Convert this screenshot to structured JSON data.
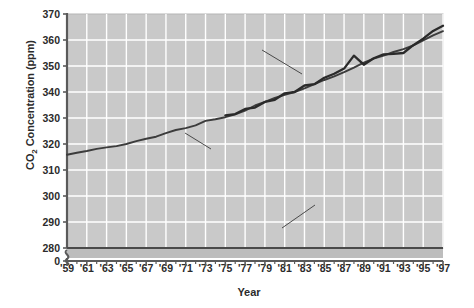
{
  "chart_data": {
    "type": "line",
    "title": "",
    "xlabel": "Year",
    "ylabel": "CO2 Concentration (ppm)",
    "ylabel_display": "CO₂ Concentration (ppm)",
    "ylim": [
      280,
      370
    ],
    "xlim": [
      1959,
      1997
    ],
    "grid": true,
    "legend_position": "inline-annotations",
    "y_ticks": [
      "370",
      "360",
      "350",
      "340",
      "330",
      "320",
      "310",
      "300",
      "290",
      "280",
      "0"
    ],
    "y_tick_values": [
      370,
      360,
      350,
      340,
      330,
      320,
      310,
      300,
      290,
      280,
      0
    ],
    "axis_break": true,
    "axis_break_note": "y-axis broken between 280 and 0",
    "x_ticks": [
      "'59",
      "'61",
      "'63",
      "'65",
      "'67",
      "'69",
      "'71",
      "'73",
      "'75",
      "'77",
      "'79",
      "'81",
      "'83",
      "'85",
      "'87",
      "'89",
      "'91",
      "'93",
      "'95",
      "'97"
    ],
    "x_tick_values": [
      1959,
      1961,
      1963,
      1965,
      1967,
      1969,
      1971,
      1973,
      1975,
      1977,
      1979,
      1981,
      1983,
      1985,
      1987,
      1989,
      1991,
      1993,
      1995,
      1997
    ],
    "annotations": [
      {
        "text": "Alert, NWT",
        "series": "Alert, NWT"
      },
      {
        "text": "Mauna Loa, Hawaii",
        "series": "Mauna Loa, Hawaii"
      },
      {
        "text": "Pre-industrial CO2",
        "text_display": "Pre-industrial CO₂",
        "series": "Pre-industrial CO2"
      }
    ],
    "series": [
      {
        "name": "Mauna Loa, Hawaii",
        "color": "#3c3c3c",
        "x": [
          1959,
          1960,
          1961,
          1962,
          1963,
          1964,
          1965,
          1966,
          1967,
          1968,
          1969,
          1970,
          1971,
          1972,
          1973,
          1974,
          1975,
          1976,
          1977,
          1978,
          1979,
          1980,
          1981,
          1982,
          1983,
          1984,
          1985,
          1986,
          1987,
          1988,
          1989,
          1990,
          1991,
          1992,
          1993,
          1994,
          1995,
          1996,
          1997
        ],
        "values": [
          315.9,
          316.6,
          317.3,
          318.1,
          318.7,
          319.2,
          320.0,
          321.1,
          322.0,
          322.8,
          324.2,
          325.4,
          326.1,
          327.2,
          328.9,
          329.5,
          330.3,
          331.4,
          332.8,
          334.8,
          336.2,
          337.7,
          338.9,
          340.0,
          341.4,
          343.0,
          344.6,
          346.0,
          347.6,
          349.4,
          351.3,
          352.8,
          354.0,
          355.4,
          356.5,
          357.9,
          359.9,
          361.8,
          363.4
        ]
      },
      {
        "name": "Alert, NWT",
        "color": "#2a2a2a",
        "x": [
          1975,
          1976,
          1977,
          1978,
          1979,
          1980,
          1981,
          1982,
          1983,
          1984,
          1985,
          1986,
          1987,
          1988,
          1989,
          1990,
          1991,
          1992,
          1993,
          1994,
          1995,
          1996,
          1997
        ],
        "values": [
          331.0,
          331.5,
          333.5,
          334.0,
          336.2,
          337.0,
          339.5,
          340.0,
          342.5,
          343.0,
          345.5,
          347.0,
          349.0,
          354.0,
          350.5,
          353.0,
          354.5,
          354.7,
          355.0,
          358.0,
          360.5,
          363.5,
          365.5
        ]
      },
      {
        "name": "Pre-industrial CO2",
        "color": "#4a4a4a",
        "constant": 280,
        "x": [
          1959,
          1997
        ],
        "values": [
          280,
          280
        ]
      }
    ]
  },
  "annotations": {
    "alert": "Alert, NWT",
    "mauna": "Mauna Loa, Hawaii",
    "preindustrial_pre": "Pre-industrial CO",
    "preindustrial_sub": "2"
  },
  "axes": {
    "y_title_pre": "CO",
    "y_title_sub": "2",
    "y_title_post": " Concentration (ppm)",
    "x_title": "Year"
  },
  "colors": {
    "plot_background": "#c9c9c9",
    "gridline": "#ffffff",
    "axis": "#5a5a5a",
    "text": "#2b2b2b",
    "line_mauna": "#3c3c3c",
    "line_alert": "#2a2a2a",
    "line_pre": "#4a4a4a"
  }
}
